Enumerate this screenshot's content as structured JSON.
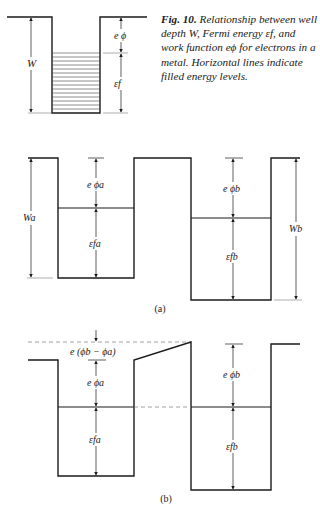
{
  "caption": {
    "fig_label": "Fig. 10.",
    "text": "Relationship between well depth W, Fermi energy εf, and work function eϕ for electrons in a metal. Horizontal lines indicate filled energy levels."
  },
  "top_diagram": {
    "label_W": "W",
    "label_ephi": "e ϕ",
    "label_ef": "εf"
  },
  "panel_a": {
    "label": "(a)",
    "label_Wa": "Wa",
    "label_ephia": "e ϕa",
    "label_efa": "εfa",
    "label_ephib": "e ϕb",
    "label_efb": "εfb",
    "label_Wb": "Wb"
  },
  "panel_b": {
    "label": "(b)",
    "label_contact": "e (ϕb − ϕa)",
    "label_ephia": "e ϕa",
    "label_efa": "εfa",
    "label_ephib": "e ϕb",
    "label_efb": "εfb"
  },
  "colors": {
    "line": "#1a1a1a",
    "dashed": "#777777",
    "background": "#ffffff"
  }
}
